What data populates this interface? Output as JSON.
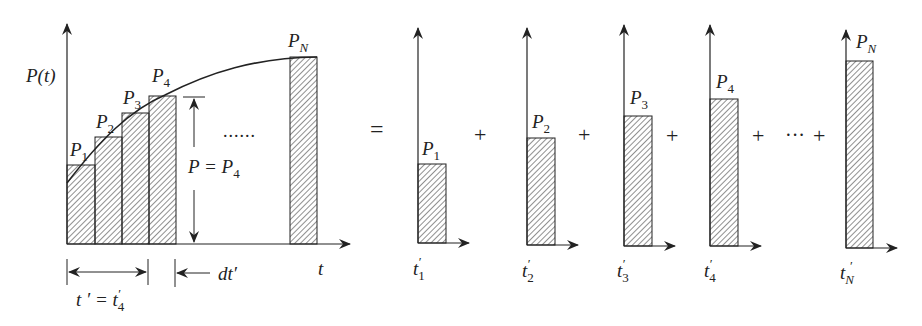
{
  "diagram": {
    "left_panel": {
      "y_axis_label": "P(t)",
      "x_axis_label": "t",
      "bars": [
        {
          "label": "P",
          "sub": "1"
        },
        {
          "label": "P",
          "sub": "2"
        },
        {
          "label": "P",
          "sub": "3"
        },
        {
          "label": "P",
          "sub": "4"
        },
        {
          "label": "P",
          "sub": "N"
        }
      ],
      "ellipsis": "......",
      "height_annotation": {
        "text": "P = P",
        "sub": "4"
      },
      "t_prime_annotation": {
        "text": "t ′ = t",
        "sub": "4",
        "prime": "′"
      },
      "dt_annotation": "dt′"
    },
    "equals": "=",
    "plus": "+",
    "dots": "···",
    "pulses": [
      {
        "label": "P",
        "sub": "1",
        "t_label": "t",
        "t_sub": "1"
      },
      {
        "label": "P",
        "sub": "2",
        "t_label": "t",
        "t_sub": "2"
      },
      {
        "label": "P",
        "sub": "3",
        "t_label": "t",
        "t_sub": "3"
      },
      {
        "label": "P",
        "sub": "4",
        "t_label": "t",
        "t_sub": "4"
      },
      {
        "label": "P",
        "sub": "N",
        "t_label": "t",
        "t_sub": "N"
      }
    ],
    "prime": "′",
    "colors": {
      "ink": "#222222",
      "background": "#ffffff"
    }
  }
}
